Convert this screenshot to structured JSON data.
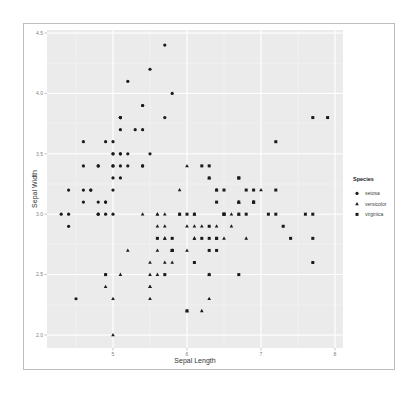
{
  "chart_data": {
    "type": "scatter",
    "title": "",
    "xlabel": "Sepal Length",
    "ylabel": "Sepal Width",
    "xlim": [
      4.3,
      8.0
    ],
    "ylim": [
      1.9,
      4.5
    ],
    "x_ticks": [
      "5",
      "6",
      "7",
      "8"
    ],
    "y_ticks": [
      "2.0",
      "2.5",
      "3.0",
      "3.5",
      "4.0",
      "4.5"
    ],
    "grid": true,
    "legend": {
      "title": "Species",
      "position": "right",
      "entries": [
        "setosa",
        "versicolor",
        "virginica"
      ]
    },
    "series": [
      {
        "name": "setosa",
        "shape": "circle",
        "x": [
          5.1,
          4.9,
          4.7,
          4.6,
          5.0,
          5.4,
          4.6,
          5.0,
          4.4,
          4.9,
          5.4,
          4.8,
          4.8,
          4.3,
          5.8,
          5.7,
          5.4,
          5.1,
          5.7,
          5.1,
          5.4,
          5.1,
          4.6,
          5.1,
          4.8,
          5.0,
          5.0,
          5.2,
          5.2,
          4.7,
          4.8,
          5.4,
          5.2,
          5.5,
          4.9,
          5.0,
          5.5,
          4.9,
          4.4,
          5.1,
          5.0,
          4.5,
          4.4,
          5.0,
          5.1,
          4.8,
          5.1,
          4.6,
          5.3,
          5.0
        ],
        "y": [
          3.5,
          3.0,
          3.2,
          3.1,
          3.6,
          3.9,
          3.4,
          3.4,
          2.9,
          3.1,
          3.7,
          3.4,
          3.0,
          3.0,
          4.0,
          4.4,
          3.9,
          3.5,
          3.8,
          3.8,
          3.4,
          3.7,
          3.6,
          3.3,
          3.4,
          3.0,
          3.4,
          3.5,
          3.4,
          3.2,
          3.1,
          3.4,
          4.1,
          4.2,
          3.1,
          3.2,
          3.5,
          3.6,
          3.0,
          3.4,
          3.5,
          2.3,
          3.2,
          3.5,
          3.8,
          3.0,
          3.8,
          3.2,
          3.7,
          3.3
        ]
      },
      {
        "name": "versicolor",
        "shape": "triangle",
        "x": [
          7.0,
          6.4,
          6.9,
          5.5,
          6.5,
          5.7,
          6.3,
          4.9,
          6.6,
          5.2,
          5.0,
          5.9,
          6.0,
          6.1,
          5.6,
          6.7,
          5.6,
          5.8,
          6.2,
          5.6,
          5.9,
          6.1,
          6.3,
          6.1,
          6.4,
          6.6,
          6.8,
          6.7,
          6.0,
          5.7,
          5.5,
          5.5,
          5.8,
          6.0,
          5.4,
          6.0,
          6.7,
          6.3,
          5.6,
          5.5,
          5.5,
          6.1,
          5.8,
          5.0,
          5.6,
          5.7,
          5.7,
          6.2,
          5.1,
          5.7
        ],
        "y": [
          3.2,
          3.2,
          3.1,
          2.3,
          2.8,
          2.8,
          3.3,
          2.4,
          2.9,
          2.7,
          2.0,
          3.0,
          2.2,
          2.9,
          2.9,
          3.1,
          3.0,
          2.7,
          2.2,
          2.5,
          3.2,
          2.8,
          2.5,
          2.8,
          2.9,
          3.0,
          2.8,
          3.0,
          2.9,
          2.6,
          2.4,
          2.4,
          2.7,
          2.7,
          3.0,
          3.4,
          3.1,
          2.3,
          3.0,
          2.5,
          2.6,
          3.0,
          2.6,
          2.3,
          2.7,
          3.0,
          2.9,
          2.9,
          2.5,
          2.8
        ]
      },
      {
        "name": "virginica",
        "shape": "square",
        "x": [
          6.3,
          5.8,
          7.1,
          6.3,
          6.5,
          7.6,
          4.9,
          7.3,
          6.7,
          7.2,
          6.5,
          6.4,
          6.8,
          5.7,
          5.8,
          6.4,
          6.5,
          7.7,
          7.7,
          6.0,
          6.9,
          5.6,
          7.7,
          6.3,
          6.7,
          7.2,
          6.2,
          6.1,
          6.4,
          7.2,
          7.4,
          7.9,
          6.4,
          6.3,
          6.1,
          7.7,
          6.3,
          6.4,
          6.0,
          6.9,
          6.7,
          6.9,
          5.8,
          6.8,
          6.7,
          6.7,
          6.3,
          6.5,
          6.2,
          5.9
        ],
        "y": [
          3.3,
          2.7,
          3.0,
          2.9,
          3.0,
          3.0,
          2.5,
          2.9,
          2.5,
          3.6,
          3.2,
          2.7,
          3.0,
          2.5,
          2.8,
          3.2,
          3.0,
          3.8,
          2.6,
          2.2,
          3.2,
          2.8,
          2.8,
          2.7,
          3.3,
          3.2,
          2.8,
          3.0,
          2.8,
          3.0,
          2.8,
          3.8,
          2.8,
          2.8,
          2.6,
          3.0,
          3.4,
          3.1,
          3.0,
          3.1,
          3.1,
          3.1,
          2.7,
          3.2,
          3.3,
          3.0,
          2.5,
          3.0,
          3.4,
          3.0
        ]
      }
    ]
  },
  "colors": {
    "panel_bg": "#ebebeb",
    "grid_major": "#ffffff",
    "point": "#1a1a1a",
    "frame": "#bdbdbd"
  }
}
